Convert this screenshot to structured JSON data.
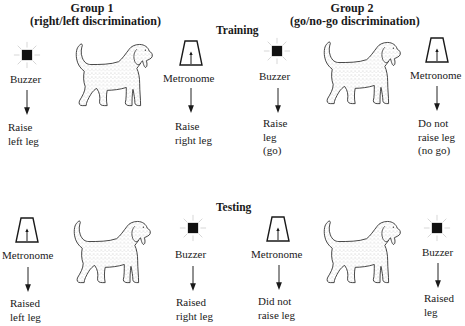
{
  "groups": [
    {
      "title": "Group 1",
      "subtitle": "(right/left discrimination)"
    },
    {
      "title": "Group 2",
      "subtitle": "(go/no-go discrimination)"
    }
  ],
  "phases": {
    "training": "Training",
    "testing": "Testing"
  },
  "stimuli": {
    "buzzer": "Buzzer",
    "metronome": "Metronome"
  },
  "icons": {
    "buzzer": "buzzer-icon",
    "metronome": "metronome-icon",
    "dog": "dog-icon",
    "arrow": "arrow-down-icon"
  },
  "training": {
    "group1": {
      "left": {
        "stimulus": "Buzzer",
        "response": [
          "Raise",
          "left leg"
        ]
      },
      "right": {
        "stimulus": "Metronome",
        "response": [
          "Raise",
          "right leg"
        ]
      }
    },
    "group2": {
      "left": {
        "stimulus": "Buzzer",
        "response": [
          "Raise",
          "leg",
          "(go)"
        ]
      },
      "right": {
        "stimulus": "Metronome",
        "response": [
          "Do not",
          "raise leg",
          "(no go)"
        ]
      }
    }
  },
  "testing": {
    "group1": {
      "left": {
        "stimulus": "Metronome",
        "response": [
          "Raised",
          "left leg"
        ]
      },
      "right": {
        "stimulus": "Buzzer",
        "response": [
          "Raised",
          "right leg"
        ]
      }
    },
    "group2": {
      "left": {
        "stimulus": "Metronome",
        "response": [
          "Did not",
          "raise leg"
        ]
      },
      "right": {
        "stimulus": "Buzzer",
        "response": [
          "Raised",
          "leg"
        ]
      }
    }
  },
  "colors": {
    "ink": "#1a1a1a",
    "background": "#ffffff",
    "ray": "#cfcfcf",
    "stipple": "#8a8a8a"
  }
}
